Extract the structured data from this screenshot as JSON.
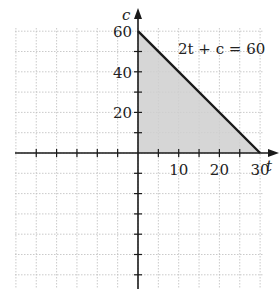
{
  "problem_number": "60.",
  "chart_data": {
    "type": "area",
    "title": "",
    "xlabel": "t",
    "ylabel": "c",
    "equation_label": "2t + c = 60",
    "line": {
      "equation": "2t + c = 60",
      "points": [
        [
          0,
          60
        ],
        [
          30,
          0
        ]
      ]
    },
    "shaded_region": {
      "vertices": [
        [
          0,
          0
        ],
        [
          0,
          60
        ],
        [
          30,
          0
        ]
      ],
      "description": "2t + c <= 60, t >= 0, c >= 0"
    },
    "x_ticks": [
      10,
      20,
      30
    ],
    "y_ticks": [
      20,
      40,
      60
    ],
    "x_tick_labels": [
      "10",
      "20",
      "30"
    ],
    "y_tick_labels": [
      "20",
      "40",
      "60"
    ],
    "xlim": [
      -30,
      31
    ],
    "ylim": [
      -65,
      62
    ],
    "x_grid_step": 5,
    "y_grid_step": 10,
    "grid": true,
    "colors": {
      "shade": "#cfcfcf",
      "line": "#1a1a1a",
      "grid": "#bdbdbd",
      "axis": "#1a1a1a"
    }
  }
}
